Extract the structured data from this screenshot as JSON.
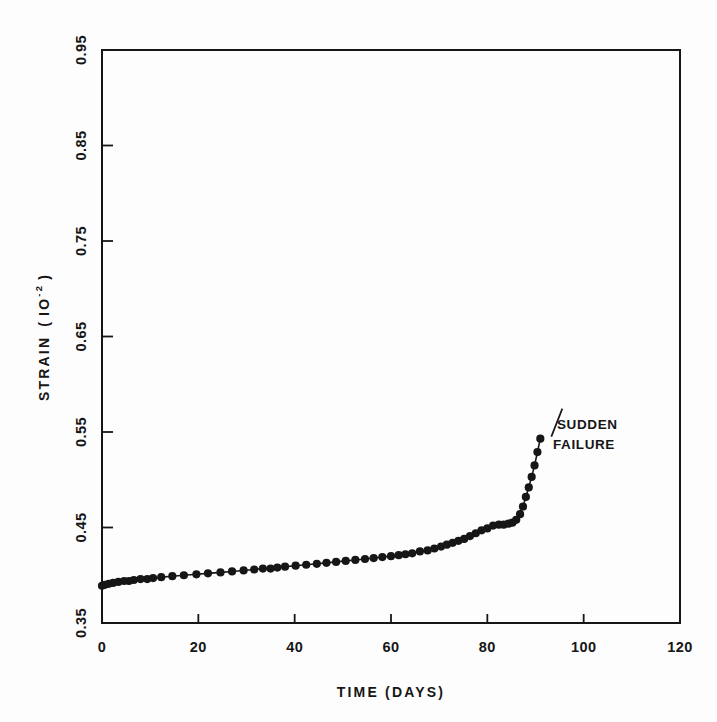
{
  "figure": {
    "background_color": "#fdfdfd",
    "ink_color": "#161616"
  },
  "chart_data": {
    "type": "line",
    "title": "",
    "subtitle": "",
    "xlabel": "TIME (DAYS)",
    "ylabel": "STRAIN (IO-2)",
    "ylabel_parts": {
      "name": "STRAIN",
      "open_paren": "(",
      "unit_base": "IO",
      "unit_exponent": "-2",
      "close_paren": ")"
    },
    "xlim": [
      0,
      120
    ],
    "ylim": [
      0.35,
      0.95
    ],
    "xticks": [
      0,
      20,
      40,
      60,
      80,
      100,
      120
    ],
    "xtick_labels": [
      "0",
      "20",
      "40",
      "60",
      "80",
      "100",
      "120"
    ],
    "yticks": [
      0.35,
      0.45,
      0.55,
      0.65,
      0.75,
      0.85,
      0.95
    ],
    "ytick_labels": [
      "0.35",
      "0.45",
      "0.55",
      "0.65",
      "0.75",
      "0.85",
      "0.95"
    ],
    "grid": false,
    "legend": null,
    "marker": "filled-circle",
    "marker_color": "#161616",
    "line_color": "#161616",
    "series": [
      {
        "name": "creep strain",
        "x": [
          0.0,
          0.6,
          1.4,
          2.3,
          3.4,
          4.6,
          5.6,
          6.6,
          8.0,
          9.4,
          10.6,
          12.3,
          14.6,
          17.0,
          19.6,
          22.0,
          24.6,
          27.0,
          29.4,
          31.6,
          33.4,
          35.0,
          36.4,
          38.0,
          40.2,
          42.4,
          44.6,
          46.6,
          48.6,
          50.6,
          52.6,
          54.6,
          56.4,
          58.2,
          60.0,
          61.6,
          63.0,
          64.4,
          66.0,
          67.6,
          69.0,
          70.4,
          71.6,
          72.8,
          74.0,
          75.2,
          76.4,
          77.6,
          78.8,
          80.0,
          81.2,
          82.4,
          83.4,
          84.4,
          85.2,
          86.0,
          86.8,
          87.4,
          88.0,
          88.6,
          89.2,
          89.8,
          90.4,
          91.0
        ],
        "y": [
          0.389,
          0.39,
          0.391,
          0.392,
          0.393,
          0.394,
          0.394,
          0.395,
          0.396,
          0.396,
          0.397,
          0.398,
          0.399,
          0.4,
          0.401,
          0.402,
          0.403,
          0.404,
          0.405,
          0.406,
          0.407,
          0.407,
          0.408,
          0.409,
          0.41,
          0.411,
          0.412,
          0.413,
          0.414,
          0.415,
          0.416,
          0.417,
          0.418,
          0.419,
          0.42,
          0.421,
          0.422,
          0.423,
          0.425,
          0.426,
          0.428,
          0.43,
          0.432,
          0.434,
          0.436,
          0.438,
          0.441,
          0.444,
          0.447,
          0.449,
          0.452,
          0.453,
          0.453,
          0.454,
          0.455,
          0.458,
          0.464,
          0.472,
          0.482,
          0.492,
          0.503,
          0.515,
          0.529,
          0.543
        ]
      }
    ],
    "annotations": [
      {
        "name": "sudden-failure",
        "lines": [
          "SUDDEN",
          "FAILURE"
        ],
        "text": "SUDDEN FAILURE",
        "point_x": 91.0,
        "point_y": 0.543,
        "leader": true
      }
    ]
  }
}
